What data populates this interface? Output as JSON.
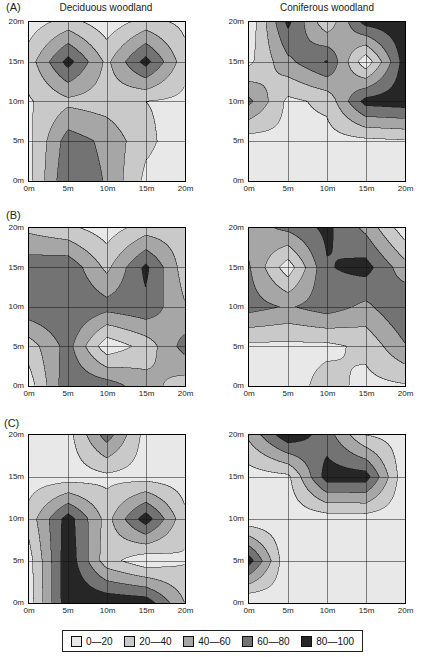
{
  "figure": {
    "row_letters": [
      "(A)",
      "(B)",
      "(C)"
    ],
    "column_titles": [
      "Deciduous woodland",
      "Coniferous woodland"
    ]
  },
  "axes": {
    "x_ticks": [
      "0m",
      "5m",
      "10m",
      "15m",
      "20m"
    ],
    "y_ticks": [
      "20m",
      "15m",
      "10m",
      "5m",
      "0m"
    ]
  },
  "legend": {
    "labels": [
      "0—20",
      "20—40",
      "40—60",
      "60—80",
      "80—100"
    ]
  },
  "colors": {
    "bands": [
      "#e8e8e8",
      "#c9c9c9",
      "#a6a6a6",
      "#737373",
      "#262626"
    ],
    "contour_line": "#1a1a1a",
    "gridline": "#111111"
  },
  "chart_data": {
    "type": "contour",
    "contour_levels": [
      20,
      40,
      60,
      80
    ],
    "band_labels": [
      "0—20",
      "20—40",
      "40—60",
      "60—80",
      "80—100"
    ],
    "x": [
      0,
      5,
      10,
      15,
      20
    ],
    "y_top_to_bottom": [
      20,
      15,
      10,
      5,
      0
    ],
    "x_unit": "m",
    "y_unit": "m",
    "panels": [
      {
        "panel": "A",
        "site": "Deciduous woodland",
        "values_rows_top_to_bottom": [
          [
            10,
            28,
            8,
            28,
            15
          ],
          [
            30,
            88,
            35,
            88,
            28
          ],
          [
            18,
            35,
            30,
            20,
            15
          ],
          [
            15,
            70,
            55,
            25,
            8
          ],
          [
            15,
            78,
            58,
            15,
            8
          ]
        ]
      },
      {
        "panel": "A",
        "site": "Coniferous woodland",
        "values_rows_top_to_bottom": [
          [
            5,
            85,
            25,
            88,
            95
          ],
          [
            15,
            55,
            82,
            5,
            90
          ],
          [
            65,
            15,
            25,
            88,
            92
          ],
          [
            10,
            15,
            12,
            15,
            18
          ],
          [
            8,
            8,
            8,
            8,
            10
          ]
        ]
      },
      {
        "panel": "B",
        "site": "Deciduous woodland",
        "values_rows_top_to_bottom": [
          [
            35,
            25,
            10,
            30,
            28
          ],
          [
            72,
            75,
            35,
            85,
            30
          ],
          [
            75,
            80,
            68,
            75,
            42
          ],
          [
            30,
            68,
            6,
            28,
            68
          ],
          [
            10,
            75,
            70,
            48,
            30
          ]
        ]
      },
      {
        "panel": "B",
        "site": "Coniferous woodland",
        "values_rows_top_to_bottom": [
          [
            50,
            65,
            85,
            55,
            8
          ],
          [
            62,
            8,
            78,
            88,
            48
          ],
          [
            68,
            58,
            70,
            55,
            80
          ],
          [
            15,
            15,
            15,
            25,
            58
          ],
          [
            10,
            10,
            28,
            14,
            18
          ]
        ]
      },
      {
        "panel": "C",
        "site": "Deciduous woodland",
        "values_rows_top_to_bottom": [
          [
            8,
            12,
            70,
            12,
            8
          ],
          [
            10,
            10,
            15,
            12,
            10
          ],
          [
            28,
            90,
            32,
            92,
            25
          ],
          [
            12,
            95,
            28,
            6,
            18
          ],
          [
            10,
            95,
            95,
            92,
            40
          ]
        ]
      },
      {
        "panel": "C",
        "site": "Coniferous woodland",
        "values_rows_top_to_bottom": [
          [
            45,
            95,
            70,
            20,
            10
          ],
          [
            10,
            15,
            90,
            90,
            5
          ],
          [
            5,
            8,
            9,
            10,
            8
          ],
          [
            90,
            2,
            8,
            8,
            8
          ],
          [
            0,
            10,
            8,
            8,
            8
          ]
        ]
      }
    ]
  }
}
